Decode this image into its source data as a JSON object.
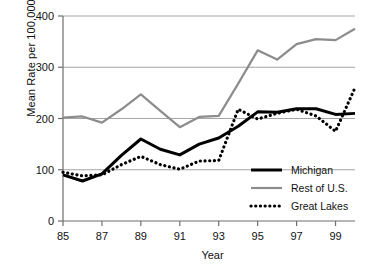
{
  "chart_data": {
    "type": "line",
    "title": "",
    "xlabel": "Year",
    "ylabel": "Mean Rate per 100,000",
    "x": [
      85,
      86,
      87,
      88,
      89,
      90,
      91,
      92,
      93,
      94,
      95,
      96,
      97,
      98,
      99,
      100
    ],
    "xtick_labels": [
      "85",
      "87",
      "89",
      "91",
      "93",
      "95",
      "97",
      "99"
    ],
    "xtick_values": [
      85,
      87,
      89,
      91,
      93,
      95,
      97,
      99
    ],
    "xlim": [
      85,
      100
    ],
    "ylim": [
      0,
      400
    ],
    "ytick_labels": [
      "0",
      "100",
      "200",
      "300",
      "400"
    ],
    "ytick_values": [
      0,
      100,
      200,
      300,
      400
    ],
    "grid": "horizontal",
    "legend_position": "inside-lower-right",
    "series": [
      {
        "name": "Michigan",
        "style": "solid-thick",
        "color": "#000000",
        "values": [
          90,
          78,
          92,
          128,
          160,
          140,
          129,
          150,
          162,
          185,
          213,
          212,
          219,
          219,
          208,
          210
        ]
      },
      {
        "name": "Rest of U.S.",
        "style": "solid",
        "color": "#8c8c8c",
        "values": [
          202,
          204,
          192,
          218,
          247,
          215,
          183,
          203,
          205,
          268,
          333,
          315,
          345,
          355,
          353,
          375
        ]
      },
      {
        "name": "Great Lakes",
        "style": "dotted",
        "color": "#000000",
        "values": [
          95,
          88,
          90,
          110,
          126,
          110,
          101,
          117,
          118,
          218,
          199,
          210,
          218,
          205,
          175,
          260
        ]
      }
    ]
  },
  "legend": {
    "items": [
      {
        "label": "Michigan",
        "swatch": "solid-thick-black"
      },
      {
        "label": "Rest of U.S.",
        "swatch": "solid-gray"
      },
      {
        "label": "Great Lakes",
        "swatch": "dotted-black"
      }
    ]
  },
  "colors": {
    "michigan": "#000000",
    "rest_of_us": "#8c8c8c",
    "great_lakes": "#000000",
    "grid": "#9a9a9a",
    "axis": "#6e6e6e"
  }
}
